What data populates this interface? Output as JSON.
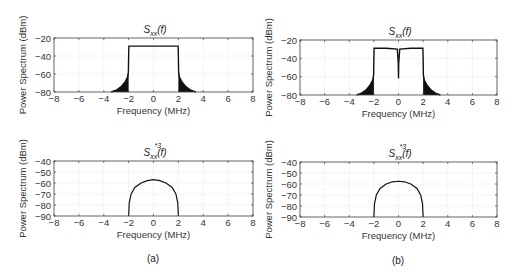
{
  "chart_data": [
    {
      "id": "a_top",
      "type": "line",
      "panel": "(a)",
      "title": "S_xx(f)",
      "title_main": "S",
      "title_sub": "xx",
      "title_sup": "",
      "title_tail": "(f)",
      "xlabel": "Frequency (MHz)",
      "ylabel": "Power Spectrum (dBm)",
      "xlim": [
        -8,
        8
      ],
      "ylim": [
        -80,
        -20
      ],
      "xticks": [
        -8,
        -6,
        -4,
        -2,
        0,
        2,
        4,
        6,
        8
      ],
      "yticks": [
        -20,
        -40,
        -60,
        -80
      ],
      "grid": true,
      "box": {
        "x": 54,
        "y": 38,
        "w": 199,
        "h": 54
      },
      "description": "Flat passband at about -29 dBm between -2 and 2 MHz with noisy spectral-regrowth skirts falling to -80 dBm near +/-3.4 MHz",
      "x": [
        -3.4,
        -3.0,
        -2.6,
        -2.3,
        -2.1,
        -2.02,
        -2.0,
        -1.98,
        -1.0,
        0,
        1.0,
        1.98,
        2.0,
        2.02,
        2.1,
        2.3,
        2.6,
        3.0,
        3.4
      ],
      "y": [
        -80,
        -78,
        -74,
        -69,
        -64,
        -58,
        -40,
        -29,
        -29,
        -29,
        -29,
        -29,
        -40,
        -58,
        -64,
        -69,
        -74,
        -78,
        -80
      ],
      "filled_skirts": true,
      "notch": null
    },
    {
      "id": "b_top",
      "type": "line",
      "panel": "(b)",
      "title": "S_xx(f)",
      "title_main": "S",
      "title_sub": "xx",
      "title_sup": "",
      "title_tail": "(f)",
      "xlabel": "Frequency (MHz)",
      "ylabel": "Power Spectrum (dBm)",
      "xlim": [
        -8,
        8
      ],
      "ylim": [
        -80,
        -20
      ],
      "xticks": [
        -8,
        -6,
        -4,
        -2,
        0,
        2,
        4,
        6,
        8
      ],
      "yticks": [
        -20,
        -40,
        -60,
        -80
      ],
      "grid": true,
      "box": {
        "x": 300,
        "y": 40,
        "w": 197,
        "h": 55
      },
      "description": "Same as (a) but with a narrow DC notch at 0 MHz dropping to about -62 dBm",
      "x": [
        -3.4,
        -3.0,
        -2.6,
        -2.3,
        -2.1,
        -2.02,
        -2.0,
        -1.98,
        -1.0,
        -0.1,
        -0.02,
        0,
        0.02,
        0.1,
        1.0,
        1.98,
        2.0,
        2.02,
        2.1,
        2.3,
        2.6,
        3.0,
        3.4
      ],
      "y": [
        -80,
        -78,
        -74,
        -69,
        -64,
        -58,
        -40,
        -29,
        -29,
        -30,
        -45,
        -62,
        -45,
        -30,
        -29,
        -29,
        -40,
        -58,
        -64,
        -69,
        -74,
        -78,
        -80
      ],
      "filled_skirts": true,
      "notch": {
        "x": 0,
        "y": -62
      }
    },
    {
      "id": "a_bottom",
      "type": "line",
      "panel": "(a)",
      "title": "S_xx^{*3}(f)",
      "title_main": "S",
      "title_sub": "xx",
      "title_sup": "*3",
      "title_tail": "(f)",
      "xlabel": "Frequency (MHz)",
      "ylabel": "Power Spectrum (dBm)",
      "xlim": [
        -8,
        8
      ],
      "ylim": [
        -90,
        -40
      ],
      "xticks": [
        -8,
        -6,
        -4,
        -2,
        0,
        2,
        4,
        6,
        8
      ],
      "yticks": [
        -40,
        -50,
        -60,
        -70,
        -80,
        -90
      ],
      "grid": true,
      "box": {
        "x": 54,
        "y": 161,
        "w": 199,
        "h": 55
      },
      "description": "Dome-shaped curve from -90 dBm at -2 MHz rising to a peak of about -57 dBm at 0 and back to -90 dBm at 2 MHz",
      "x": [
        -2.0,
        -1.95,
        -1.8,
        -1.5,
        -1.0,
        -0.5,
        0,
        0.5,
        1.0,
        1.5,
        1.8,
        1.95,
        2.0
      ],
      "y": [
        -90,
        -78,
        -70,
        -64,
        -60,
        -57.8,
        -57,
        -57.8,
        -60,
        -64,
        -70,
        -78,
        -90
      ],
      "filled_skirts": false,
      "notch": null
    },
    {
      "id": "b_bottom",
      "type": "line",
      "panel": "(b)",
      "title": "S_xx^{*3}(f)",
      "title_main": "S",
      "title_sub": "xx",
      "title_sup": "*3",
      "title_tail": "(f)",
      "xlabel": "Frequency (MHz)",
      "ylabel": "Power Spectrum (dBm)",
      "xlim": [
        -8,
        8
      ],
      "ylim": [
        -90,
        -40
      ],
      "xticks": [
        -8,
        -6,
        -4,
        -2,
        0,
        2,
        4,
        6,
        8
      ],
      "yticks": [
        -40,
        -50,
        -60,
        -70,
        -80,
        -90
      ],
      "grid": true,
      "box": {
        "x": 300,
        "y": 162,
        "w": 197,
        "h": 55
      },
      "description": "Dome-shaped curve from -90 dBm at -2 MHz rising to a peak of about -57.5 dBm at 0 and back to -90 dBm at 2 MHz",
      "x": [
        -2.0,
        -1.95,
        -1.8,
        -1.5,
        -1.0,
        -0.5,
        0,
        0.5,
        1.0,
        1.5,
        1.8,
        1.95,
        2.0
      ],
      "y": [
        -90,
        -78,
        -70,
        -64,
        -60,
        -58,
        -57.5,
        -58,
        -60,
        -64,
        -70,
        -78,
        -90
      ],
      "filled_skirts": false,
      "notch": null
    }
  ],
  "captions": {
    "a": "(a)",
    "b": "(b)"
  },
  "colors": {
    "line": "#111111",
    "axes": "#444444",
    "grid": "#dddddd",
    "background": "#ffffff"
  }
}
